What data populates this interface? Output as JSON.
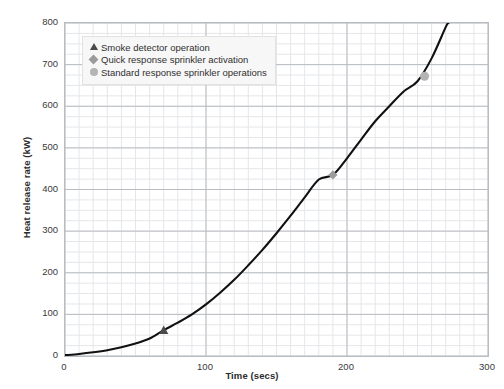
{
  "chart_data": {
    "type": "line",
    "title": "",
    "xlabel": "Time (secs)",
    "ylabel": "Heat release rate (kW)",
    "xlim": [
      0,
      300
    ],
    "ylim": [
      0,
      800
    ],
    "xticks": [
      0,
      100,
      200,
      300
    ],
    "yticks": [
      0,
      100,
      200,
      300,
      400,
      500,
      600,
      700,
      800
    ],
    "x_minor_step": 10,
    "y_minor_step": 25,
    "grid": true,
    "legend_position": "upper left",
    "series": [
      {
        "name": "Heat release rate",
        "style": "solid-black-curve",
        "color": "#111111",
        "x": [
          0,
          10,
          20,
          30,
          40,
          50,
          60,
          70,
          80,
          90,
          100,
          110,
          120,
          130,
          140,
          150,
          160,
          170,
          180,
          190,
          200,
          210,
          220,
          230,
          240,
          250,
          260,
          270,
          272
        ],
        "y": [
          2,
          5,
          9,
          14,
          21,
          30,
          42,
          62,
          80,
          100,
          124,
          152,
          183,
          218,
          255,
          295,
          337,
          381,
          424,
          435,
          475,
          520,
          564,
          600,
          635,
          660,
          715,
          790,
          800
        ]
      }
    ],
    "markers": [
      {
        "label": "Smoke detector operation",
        "shape": "triangle",
        "color": "#4a4a4a",
        "x": 70,
        "y": 62
      },
      {
        "label": "Quick response sprinkler activation",
        "shape": "diamond",
        "color": "#9b9b9b",
        "x": 190,
        "y": 435
      },
      {
        "label": "Standard response sprinkler operations",
        "shape": "circle",
        "color": "#b4b4b4",
        "x": 255,
        "y": 672
      }
    ],
    "legend": [
      {
        "label": "Smoke detector operation",
        "shape": "triangle",
        "color": "#4a4a4a"
      },
      {
        "label": "Quick response sprinkler activation",
        "shape": "diamond",
        "color": "#9b9b9b"
      },
      {
        "label": "Standard response sprinkler operations",
        "shape": "circle",
        "color": "#b4b4b4"
      }
    ],
    "colors": {
      "curve": "#111111",
      "major_grid": "#b9bcc0",
      "minor_grid": "#e4e6e9",
      "frame": "#b9bcc0",
      "background": "#ffffff",
      "legend_background": "#f7f7f7"
    }
  }
}
